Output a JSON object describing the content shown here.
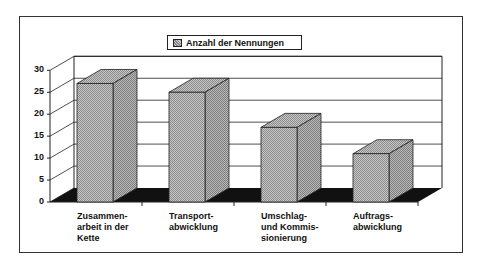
{
  "chart_data": {
    "type": "bar",
    "style": "3d-column",
    "title": "",
    "xlabel": "",
    "ylabel": "",
    "categories": [
      "Zusammen-\narbeit in der\nKette",
      "Transport-\nabwicklung",
      "Umschlag-\nund Kommis-\nsionierung",
      "Auftrags-\nabwicklung"
    ],
    "series": [
      {
        "name": "Anzahl der Nennungen",
        "values": [
          27,
          25,
          17,
          11
        ]
      }
    ],
    "ylim": [
      0,
      30
    ],
    "yticks": [
      "0",
      "5",
      "10",
      "15",
      "20",
      "25",
      "30"
    ],
    "grid": true,
    "legend_position": "top"
  },
  "legend": {
    "label": "Anzahl der Nennungen"
  },
  "colors": {
    "bar_fill": "#b0b0b0",
    "floor": "#111111",
    "gridline": "#222222"
  }
}
